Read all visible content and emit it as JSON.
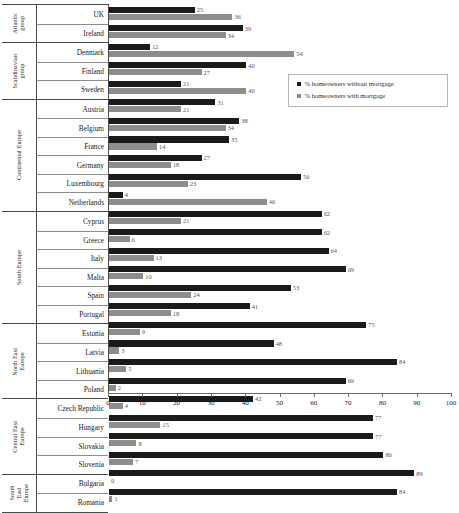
{
  "chart_data": {
    "type": "bar",
    "orientation": "horizontal",
    "title": "",
    "xlabel": "%",
    "ylabel": "",
    "xlim": [
      0,
      100
    ],
    "xticks": [
      0,
      10,
      20,
      30,
      40,
      50,
      60,
      70,
      80,
      90,
      100
    ],
    "grid": false,
    "legend_position": "top-right",
    "categories": [
      "UK",
      "Ireland",
      "Denmark",
      "Finland",
      "Sweden",
      "Austria",
      "Belgium",
      "France",
      "Germany",
      "Luxembourg",
      "Netherlands",
      "Cyprus",
      "Greece",
      "Italy",
      "Malta",
      "Spain",
      "Portugal",
      "Estonia",
      "Latvia",
      "Lithuania",
      "Poland",
      "Czech Republic",
      "Hungary",
      "Slovakia",
      "Slovenia",
      "Bulgaria",
      "Romania"
    ],
    "series": [
      {
        "name": "% homeowners without mortgage",
        "color": "#1a1a1a",
        "values": [
          25,
          39,
          12,
          40,
          21,
          31,
          38,
          35,
          27,
          56,
          4,
          62,
          62,
          64,
          69,
          53,
          41,
          75,
          48,
          84,
          69,
          42,
          77,
          77,
          80,
          89,
          84
        ]
      },
      {
        "name": "% homeowners with mortgage",
        "color": "#8d8d8d",
        "values": [
          36,
          34,
          54,
          27,
          40,
          21,
          34,
          14,
          18,
          23,
          46,
          21,
          6,
          13,
          10,
          24,
          18,
          9,
          3,
          5,
          2,
          4,
          15,
          8,
          7,
          0,
          1
        ]
      }
    ]
  },
  "groups": [
    {
      "name": "Atlantic\ngroup",
      "countries": [
        {
          "label": "UK",
          "dark": 25,
          "light": 36
        },
        {
          "label": "Ireland",
          "dark": 39,
          "light": 34
        }
      ]
    },
    {
      "name": "Scandinavian\ngroup",
      "countries": [
        {
          "label": "Denmark",
          "dark": 12,
          "light": 54
        },
        {
          "label": "Finland",
          "dark": 40,
          "light": 27
        },
        {
          "label": "Sweden",
          "dark": 21,
          "light": 40
        }
      ]
    },
    {
      "name": "Continental Europe",
      "countries": [
        {
          "label": "Austria",
          "dark": 31,
          "light": 21
        },
        {
          "label": "Belgium",
          "dark": 38,
          "light": 34
        },
        {
          "label": "France",
          "dark": 35,
          "light": 14
        },
        {
          "label": "Germany",
          "dark": 27,
          "light": 18
        },
        {
          "label": "Luxembourg",
          "dark": 56,
          "light": 23
        },
        {
          "label": "Netherlands",
          "dark": 4,
          "light": 46
        }
      ]
    },
    {
      "name": "South Europe",
      "countries": [
        {
          "label": "Cyprus",
          "dark": 62,
          "light": 21
        },
        {
          "label": "Greece",
          "dark": 62,
          "light": 6
        },
        {
          "label": "Italy",
          "dark": 64,
          "light": 13
        },
        {
          "label": "Malta",
          "dark": 69,
          "light": 10
        },
        {
          "label": "Spain",
          "dark": 53,
          "light": 24
        },
        {
          "label": "Portugal",
          "dark": 41,
          "light": 18
        }
      ]
    },
    {
      "name": "North East\nEurope",
      "countries": [
        {
          "label": "Estonia",
          "dark": 75,
          "light": 9
        },
        {
          "label": "Latvia",
          "dark": 48,
          "light": 3
        },
        {
          "label": "Lithuania",
          "dark": 84,
          "light": 5
        },
        {
          "label": "Poland",
          "dark": 69,
          "light": 2
        }
      ]
    },
    {
      "name": "Central East\nEurope",
      "countries": [
        {
          "label": "Czech Republic",
          "dark": 42,
          "light": 4
        },
        {
          "label": "Hungary",
          "dark": 77,
          "light": 15
        },
        {
          "label": "Slovakia",
          "dark": 77,
          "light": 8
        },
        {
          "label": "Slovenia",
          "dark": 80,
          "light": 7
        }
      ]
    },
    {
      "name": "South\nEast\nEurope",
      "countries": [
        {
          "label": "Bulgaria",
          "dark": 89,
          "light": 0
        },
        {
          "label": "Romania",
          "dark": 84,
          "light": 1
        }
      ]
    }
  ],
  "legend": {
    "items": [
      {
        "label": "% homeowners without mortgage",
        "color": "#1a1a1a"
      },
      {
        "label": "% homeowners with mortgage",
        "color": "#8d8d8d"
      }
    ]
  },
  "axis": {
    "x_title": "%",
    "ticks": [
      "0",
      "10",
      "20",
      "30",
      "40",
      "50",
      "60",
      "70",
      "80",
      "90",
      "100"
    ]
  }
}
